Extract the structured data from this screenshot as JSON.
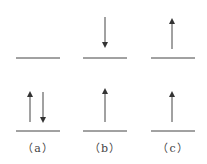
{
  "diagram": {
    "type": "spin-orbital-diagram",
    "panels": [
      {
        "label": "（a）",
        "upper_level": [],
        "lower_level": [
          "up",
          "down"
        ]
      },
      {
        "label": "（b）",
        "upper_level": [
          "down"
        ],
        "lower_level": [
          "up"
        ]
      },
      {
        "label": "（c）",
        "upper_level": [
          "up"
        ],
        "lower_level": [
          "up"
        ]
      }
    ],
    "colors": {
      "line": "#333333",
      "text": "#444444"
    }
  }
}
